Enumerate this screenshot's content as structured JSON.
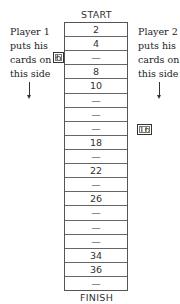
{
  "board": {
    "start_label": "START",
    "finish_label": "FINISH",
    "cells": [
      "2",
      "4",
      "—",
      "8",
      "10",
      "—",
      "—",
      "—",
      "18",
      "—",
      "22",
      "—",
      "26",
      "—",
      "—",
      "—",
      "34",
      "36",
      "—"
    ]
  },
  "player1": {
    "lines": [
      "Player 1",
      "puts his",
      "cards on",
      "this side"
    ],
    "card": "6"
  },
  "player2": {
    "lines": [
      "Player 2",
      "puts his",
      "cards on",
      "this side"
    ],
    "card": "16"
  }
}
